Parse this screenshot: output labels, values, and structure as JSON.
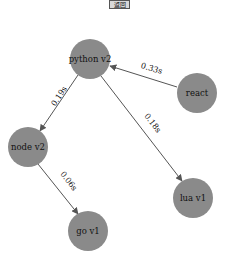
{
  "toolbar": {
    "button_label": "返回"
  },
  "graph": {
    "node_color": "#8a8a8a",
    "edge_color": "#555555",
    "nodes": [
      {
        "id": "python",
        "label": "python v2",
        "x": 90,
        "y": 59
      },
      {
        "id": "react",
        "label": "react",
        "x": 197,
        "y": 93
      },
      {
        "id": "node",
        "label": "node v2",
        "x": 28,
        "y": 147
      },
      {
        "id": "lua",
        "label": "lua v1",
        "x": 193,
        "y": 198
      },
      {
        "id": "go",
        "label": "go v1",
        "x": 88,
        "y": 231
      }
    ],
    "edges": [
      {
        "from": "react",
        "to": "python",
        "label": "0.33s"
      },
      {
        "from": "python",
        "to": "node",
        "label": "0.19s"
      },
      {
        "from": "python",
        "to": "lua",
        "label": "0.18s"
      },
      {
        "from": "node",
        "to": "go",
        "label": "0.06s"
      }
    ]
  }
}
